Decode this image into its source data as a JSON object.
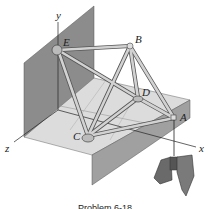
{
  "figure": {
    "type": "space-truss-diagram",
    "axes": {
      "x": "x",
      "y": "y",
      "z": "z"
    },
    "joints": {
      "A": "A",
      "B": "B",
      "C": "C",
      "D": "D",
      "E": "E"
    },
    "members": [
      "EB",
      "EC",
      "ED",
      "BC",
      "BD",
      "BA",
      "CD",
      "CA",
      "DA"
    ],
    "load": "suspended-weight-at-A",
    "caption": "Problem 6-18",
    "colors": {
      "wall": "#8a8a8a",
      "floor": "#d9d9d9",
      "floor_side": "#9c9c9c",
      "member": "#c8c8c8",
      "member_edge": "#555555",
      "weight": "#6e6e6e"
    }
  }
}
